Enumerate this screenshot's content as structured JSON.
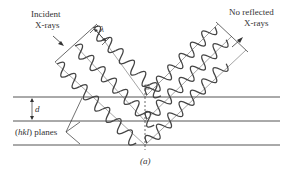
{
  "figure": {
    "caption": "(a)",
    "incident_label_line1": "Incident",
    "incident_label_line2": "X-rays",
    "reflected_label_line1": "No reflected",
    "reflected_label_line2": "X-rays",
    "wavelength_symbol": "λ",
    "spacing_symbol": "d",
    "planes_label_prefix": "(",
    "planes_label_hkl": "hkl",
    "planes_label_suffix": ") planes"
  }
}
